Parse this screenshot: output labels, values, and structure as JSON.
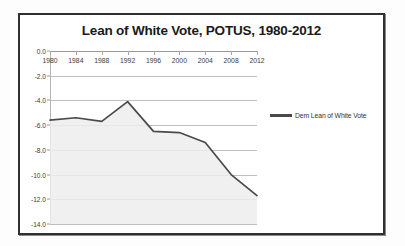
{
  "chart_data": {
    "type": "line",
    "title": "Lean of White Vote, POTUS, 1980-2012",
    "xlabel": "",
    "ylabel": "",
    "categories": [
      "1980",
      "1984",
      "1988",
      "1992",
      "1996",
      "2000",
      "2004",
      "2008",
      "2012"
    ],
    "x": [
      1980,
      1984,
      1988,
      1992,
      1996,
      2000,
      2004,
      2008,
      2012
    ],
    "series": [
      {
        "name": "Dem Lean of White Vote",
        "values": [
          -5.6,
          -5.4,
          -5.7,
          -4.1,
          -6.5,
          -6.6,
          -7.4,
          -10.0,
          -11.7
        ],
        "color": "#4a4a4a"
      }
    ],
    "ylim": [
      -14.0,
      0.0
    ],
    "ytick_labels": [
      "0.0",
      "-2.0",
      "-4.0",
      "-6.0",
      "-8.0",
      "-10.0",
      "-12.0",
      "-14.0"
    ],
    "ytick_values": [
      0.0,
      -2.0,
      -4.0,
      -6.0,
      -8.0,
      -10.0,
      -12.0,
      -14.0
    ],
    "xtick_labels": [
      "1980",
      "1984",
      "1988",
      "1992",
      "1996",
      "2000",
      "2004",
      "2008",
      "2012"
    ],
    "grid": true,
    "legend_position": "right",
    "legend_entries": [
      "Dem Lean of White Vote"
    ],
    "annotations": [],
    "shaded_area_under_line": true
  },
  "colors": {
    "series_line": "#4a4a4a",
    "gridline": "#bfbfbf",
    "axis": "#9a9a9a",
    "frame_border": "#2f2f2f",
    "title_text": "#1a1a1a",
    "tick_text": "#3a3a3a",
    "plot_background": "#ffffff",
    "page_background": "#fdfdfd",
    "area_fill": "#ededed"
  }
}
